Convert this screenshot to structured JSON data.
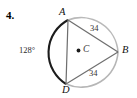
{
  "figure": {
    "problem_number": "4.",
    "shape": "circle-with-inscribed-triangle",
    "circle": {
      "center_label": "C",
      "center_dot": "center-point-dot",
      "cx": 81,
      "cy": 51,
      "r": 37,
      "dark_stroke_color": "#1c1c1c",
      "light_stroke_color": "#b9b9b9"
    },
    "vertices": [
      {
        "name": "A",
        "label": "A",
        "x": 68,
        "y": 20
      },
      {
        "name": "B",
        "label": "B",
        "x": 118,
        "y": 52
      },
      {
        "name": "D",
        "label": "D",
        "x": 66,
        "y": 84
      }
    ],
    "chords": [
      {
        "name": "chord-ab",
        "from": "A",
        "to": "B",
        "measure_label": "34"
      },
      {
        "name": "chord-db",
        "from": "D",
        "to": "B",
        "measure_label": "34"
      },
      {
        "name": "chord-ad",
        "from": "A",
        "to": "D",
        "measure_label": ""
      }
    ],
    "arc_measure": {
      "name": "arc-ad-measure",
      "label": "128°",
      "value": 128,
      "unit": "degrees"
    },
    "chord_measures": {
      "ab": "34",
      "db": "34"
    }
  }
}
